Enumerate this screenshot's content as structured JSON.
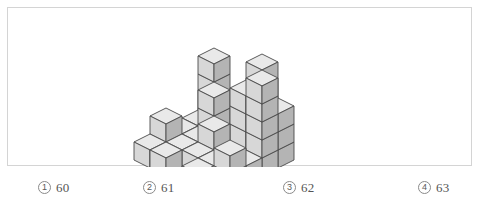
{
  "figure": {
    "caption_alt": "isometric stack of unit cubes",
    "colors": {
      "top_face": "#e9e9e9",
      "left_face": "#d7d7d7",
      "right_face": "#b4b4b4",
      "edge_stroke": "#4a4a4a",
      "frame_border": "#d4d4d4",
      "background": "#ffffff"
    },
    "projection": {
      "type": "isometric",
      "cube_width_px": 16,
      "cube_half_height_px": 8,
      "cube_vertical_px": 18,
      "origin_x_px": 190,
      "origin_y_px": 120
    },
    "grid": {
      "rows": 5,
      "cols": 5,
      "description": "height map of stacked unit cubes, value = number of cubes in that column",
      "heights": [
        [
          4,
          1,
          0,
          5,
          3
        ],
        [
          1,
          3,
          1,
          4,
          5
        ],
        [
          1,
          1,
          2,
          1,
          1
        ],
        [
          2,
          1,
          1,
          1,
          2
        ],
        [
          1,
          1,
          0,
          1,
          1
        ]
      ]
    },
    "total_cubes": 62
  },
  "options": {
    "items": [
      {
        "marker": "1",
        "value": "60"
      },
      {
        "marker": "2",
        "value": "61"
      },
      {
        "marker": "3",
        "value": "62"
      },
      {
        "marker": "4",
        "value": "63"
      }
    ]
  }
}
